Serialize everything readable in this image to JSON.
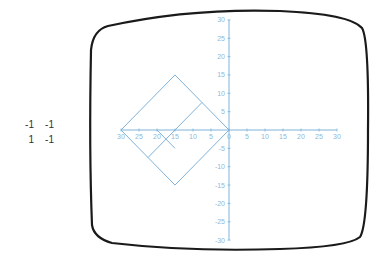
{
  "matrix": {
    "rows": [
      [
        "-1",
        "-1"
      ],
      [
        "1",
        "-1"
      ]
    ]
  },
  "screen": {
    "frame_color": "#1a1a1a",
    "plot_color": "#7fb2da"
  },
  "chart_data": {
    "type": "line",
    "title": "",
    "xlabel": "",
    "ylabel": "",
    "xlim": [
      -30,
      30
    ],
    "ylim": [
      -30,
      30
    ],
    "x_ticks": [
      "-30",
      "-25",
      "-20",
      "-15",
      "-10",
      "-5",
      "0",
      "5",
      "10",
      "15",
      "20",
      "25",
      "30"
    ],
    "y_ticks": [
      "30",
      "25",
      "20",
      "15",
      "10",
      "5",
      "0",
      "-5",
      "-10",
      "-15",
      "-20",
      "-25",
      "-30"
    ],
    "grid": false,
    "shapes": [
      {
        "name": "transformed-square",
        "points": [
          [
            0,
            0
          ],
          [
            -15,
            15
          ],
          [
            -30,
            0
          ],
          [
            -15,
            -15
          ],
          [
            0,
            0
          ]
        ]
      },
      {
        "name": "midline",
        "points": [
          [
            -7.5,
            7.5
          ],
          [
            -22.5,
            -7.5
          ]
        ]
      },
      {
        "name": "short-segment",
        "points": [
          [
            -20,
            0
          ],
          [
            -15,
            -5
          ]
        ]
      }
    ]
  }
}
